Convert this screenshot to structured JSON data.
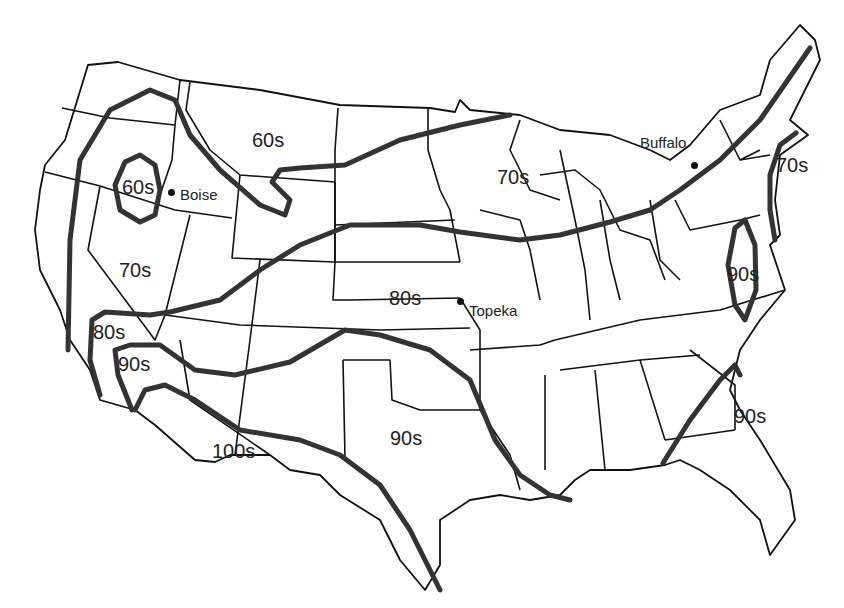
{
  "map": {
    "subject": "Contiguous United States summer temperature isotherms",
    "isotherm_color": "#333333",
    "border_color": "#111111",
    "background": "#ffffff"
  },
  "isotherm_labels": [
    {
      "id": "lbl-60s-montana",
      "text": "60s",
      "x": 252,
      "y": 130
    },
    {
      "id": "lbl-60s-oregon",
      "text": "60s",
      "x": 122,
      "y": 177
    },
    {
      "id": "lbl-70s-nevada",
      "text": "70s",
      "x": 119,
      "y": 260
    },
    {
      "id": "lbl-70s-wisconsin",
      "text": "70s",
      "x": 497,
      "y": 167
    },
    {
      "id": "lbl-70s-newengland",
      "text": "70s",
      "x": 776,
      "y": 155
    },
    {
      "id": "lbl-80s-kansas",
      "text": "80s",
      "x": 389,
      "y": 288
    },
    {
      "id": "lbl-80s-california",
      "text": "80s",
      "x": 93,
      "y": 322
    },
    {
      "id": "lbl-90s-california",
      "text": "90s",
      "x": 118,
      "y": 354
    },
    {
      "id": "lbl-90s-texas",
      "text": "90s",
      "x": 390,
      "y": 428
    },
    {
      "id": "lbl-90s-virginia",
      "text": "90s",
      "x": 727,
      "y": 264
    },
    {
      "id": "lbl-90s-georgia",
      "text": "90s",
      "x": 734,
      "y": 406
    },
    {
      "id": "lbl-100s-arizona",
      "text": "100s",
      "x": 212,
      "y": 441
    }
  ],
  "cities": [
    {
      "id": "boise",
      "name": "Boise",
      "dot_x": 171,
      "dot_y": 192,
      "label_x": 180,
      "label_y": 187
    },
    {
      "id": "topeka",
      "name": "Topeka",
      "dot_x": 460,
      "dot_y": 301,
      "label_x": 469,
      "label_y": 303
    },
    {
      "id": "buffalo",
      "name": "Buffalo",
      "dot_x": 694,
      "dot_y": 165,
      "label_x": 640,
      "label_y": 135
    }
  ]
}
